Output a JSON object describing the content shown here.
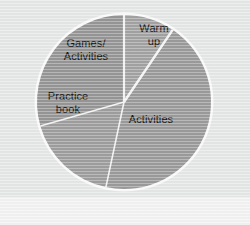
{
  "figure": {
    "background_color": "#e6e7e7",
    "bottom_band_color": "#f3f3f3"
  },
  "chart_data": {
    "type": "pie",
    "title": "",
    "subtitle": "",
    "xlabel": "",
    "ylabel": "",
    "legend_position": "none",
    "labels_position": "inside-slices",
    "grid": false,
    "start_angle_deg": 0,
    "direction": "clockwise",
    "categories": [
      "Warm up",
      "Activities",
      "Practice book",
      "Games/Activities"
    ],
    "values": [
      9.5,
      44,
      17,
      29.5
    ],
    "value_unit": "percent",
    "slices": [
      {
        "label": "Warm up",
        "label_lines": "Warm\nup",
        "value": 9.5,
        "start_angle_deg": 0,
        "end_angle_deg": 34,
        "color": "#a3a3a3"
      },
      {
        "label": "Activities",
        "label_lines": "Activities",
        "value": 44,
        "start_angle_deg": 34,
        "end_angle_deg": 192,
        "color": "#9b9b9b"
      },
      {
        "label": "Practice book",
        "label_lines": "Practice\nbook",
        "value": 17,
        "start_angle_deg": 192,
        "end_angle_deg": 254,
        "color": "#9e9e9e"
      },
      {
        "label": "Games/Activities",
        "label_lines": "Games/\nActivities",
        "value": 29.5,
        "start_angle_deg": 254,
        "end_angle_deg": 360,
        "color": "#969696"
      }
    ],
    "divider_color": "#f4f4f4",
    "center": {
      "x": 124,
      "y": 102
    },
    "radius": 87
  }
}
